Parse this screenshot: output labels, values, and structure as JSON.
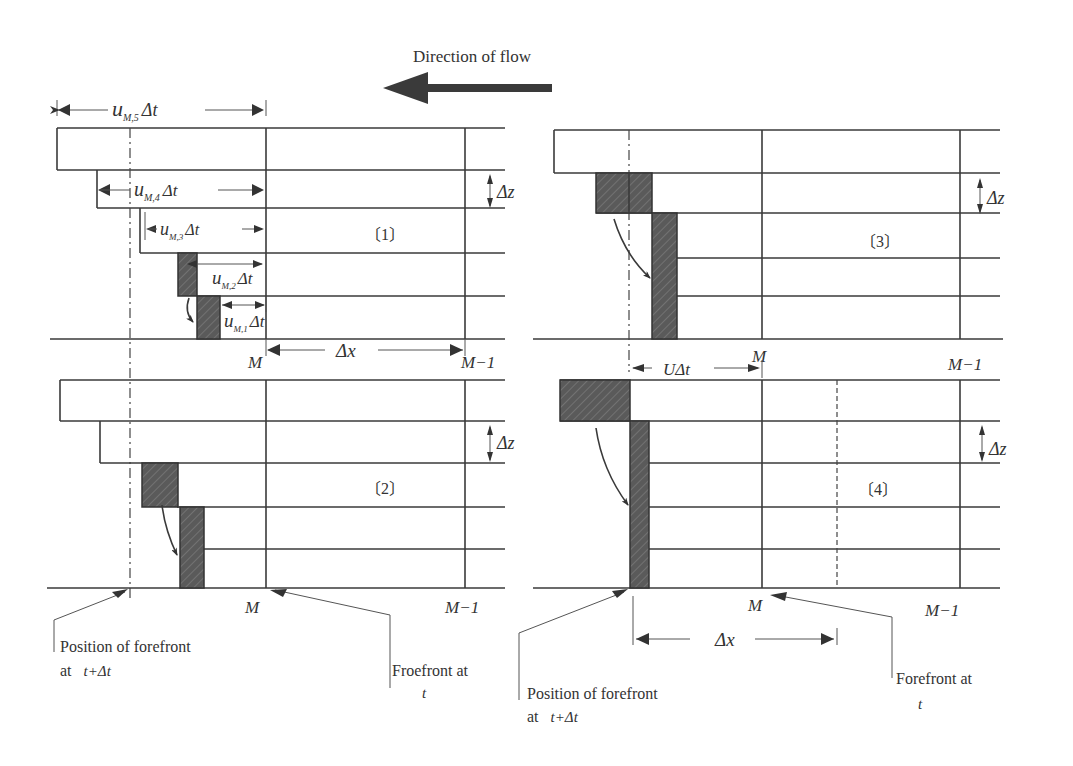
{
  "title": "Direction of flow",
  "panels": [
    {
      "id": "1",
      "label": "〔1〕",
      "dims": [
        "u_{M,5}Δt",
        "u_{M,4}Δt",
        "u_{M,3}Δt",
        "u_{M,2}Δt",
        "u_{M,1}Δt"
      ]
    },
    {
      "id": "2",
      "label": "〔2〕"
    },
    {
      "id": "3",
      "label": "〔3〕"
    },
    {
      "id": "4",
      "label": "〔4〕"
    }
  ],
  "labels": {
    "u": "u",
    "sub5": "M,5",
    "sub4": "M,4",
    "sub3": "M,3",
    "sub2": "M,2",
    "sub1": "M,1",
    "dt": "Δt",
    "dz": "Δz",
    "dx": "Δx",
    "udt": "UΔt",
    "M": "M",
    "M1": "M−1",
    "p1": "〔1〕",
    "p2": "〔2〕",
    "p3": "〔3〕",
    "p4": "〔4〕"
  },
  "annotations": {
    "left_pos_line1": "Position of forefront",
    "left_pos_line2_prefix": "at ",
    "left_pos_line2_math": "t+Δt",
    "left_front_line1": "Froefront at",
    "left_front_line2": "t",
    "right_pos_line1": "Position of forefront",
    "right_pos_line2_prefix": "at ",
    "right_pos_line2_math": "t+Δt",
    "right_front_line1": "Forefront at",
    "right_front_line2": "t"
  }
}
